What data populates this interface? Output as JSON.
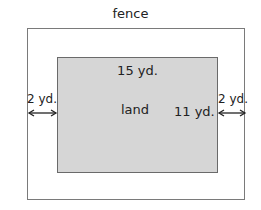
{
  "diagram": {
    "fence_label": "fence",
    "land_label": "land",
    "land_width_label": "15 yd.",
    "land_height_label": "11 yd.",
    "left_gap_label": "2 yd.",
    "right_gap_label": "2 yd."
  },
  "colors": {
    "land_fill": "#d6d6d6",
    "border": "#7a7a7a",
    "text": "#222222"
  }
}
